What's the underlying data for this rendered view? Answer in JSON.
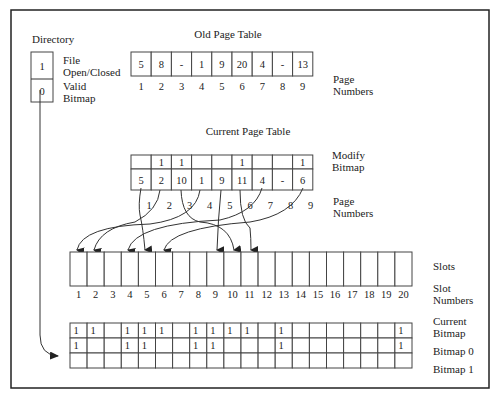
{
  "directory": {
    "title": "Directory",
    "fields": [
      {
        "value": "1",
        "label_line1": "File",
        "label_line2": "Open/Closed"
      },
      {
        "value": "0",
        "label_line1": "Valid",
        "label_line2": "Bitmap"
      }
    ]
  },
  "old_page_table": {
    "title": "Old Page Table",
    "entries": [
      "5",
      "8",
      "-",
      "1",
      "9",
      "20",
      "4",
      "-",
      "13"
    ],
    "page_numbers": [
      "1",
      "2",
      "3",
      "4",
      "5",
      "6",
      "7",
      "8",
      "9"
    ],
    "page_numbers_label_line1": "Page",
    "page_numbers_label_line2": "Numbers"
  },
  "current_page_table": {
    "title": "Current Page Table",
    "modify_bitmap": [
      "",
      "1",
      "1",
      "",
      "",
      "1",
      "",
      "",
      "1"
    ],
    "modify_bitmap_label_line1": "Modify",
    "modify_bitmap_label_line2": "Bitmap",
    "entries": [
      "5",
      "2",
      "10",
      "1",
      "9",
      "11",
      "4",
      "-",
      "6"
    ],
    "page_numbers": [
      "1",
      "2",
      "3",
      "4",
      "5",
      "6",
      "7",
      "8",
      "9"
    ],
    "page_numbers_label_line1": "Page",
    "page_numbers_label_line2": "Numbers"
  },
  "slots": {
    "label": "Slots",
    "numbers": [
      "1",
      "2",
      "3",
      "4",
      "5",
      "6",
      "7",
      "8",
      "9",
      "10",
      "11",
      "12",
      "13",
      "14",
      "15",
      "16",
      "17",
      "18",
      "19",
      "20"
    ],
    "numbers_label_line1": "Slot",
    "numbers_label_line2": "Numbers"
  },
  "bitmaps": {
    "current": {
      "label_line1": "Current",
      "label_line2": "Bitmap",
      "values": [
        "1",
        "1",
        "",
        "1",
        "1",
        "1",
        "",
        "1",
        "1",
        "1",
        "1",
        "",
        "1",
        "",
        "",
        "",
        "",
        "",
        "",
        "1"
      ]
    },
    "bitmap0": {
      "label": "Bitmap 0",
      "values": [
        "1",
        "",
        "",
        "1",
        "1",
        "",
        "",
        "1",
        "1",
        "",
        "",
        "",
        "1",
        "",
        "",
        "",
        "",
        "",
        "",
        "1"
      ]
    },
    "bitmap1": {
      "label": "Bitmap 1",
      "values": [
        "",
        "",
        "",
        "",
        "",
        "",
        "",
        "",
        "",
        "",
        "",
        "",
        "",
        "",
        "",
        "",
        "",
        "",
        "",
        ""
      ]
    }
  }
}
